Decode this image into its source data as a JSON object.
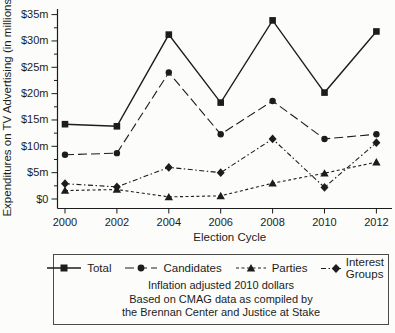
{
  "figure": {
    "ylabel": "Expenditures on TV Advertising (in millions)",
    "xlabel": "Election Cycle",
    "note_lines": [
      "Inflation adjusted 2010 dollars",
      "Based on CMAG data as compiled by",
      "the Brennan Center and Justice at Stake"
    ]
  },
  "chart_data": {
    "type": "line",
    "title": "",
    "xlabel": "Election Cycle",
    "ylabel": "Expenditures on TV Advertising (in millions)",
    "x": [
      2000,
      2002,
      2004,
      2006,
      2008,
      2010,
      2012
    ],
    "x_tick_labels": [
      "2000",
      "2002",
      "2004",
      "2006",
      "2008",
      "2010",
      "2012"
    ],
    "ylim": [
      0,
      35
    ],
    "y_major_step": 5,
    "y_minor_step": 2.5,
    "y_tick_labels": [
      "$0",
      "$5m",
      "$10m",
      "$15m",
      "$20m",
      "$25m",
      "$30m",
      "$35m"
    ],
    "grid": false,
    "legend_position": "bottom-box",
    "ink_color": "#1c1c1c",
    "series": [
      {
        "name": "Total",
        "marker": "square",
        "line": "solid",
        "values": [
          14.2,
          13.8,
          31.2,
          18.3,
          33.9,
          20.2,
          31.8
        ]
      },
      {
        "name": "Candidates",
        "marker": "circle",
        "line": "long-dash",
        "values": [
          8.4,
          8.7,
          24.0,
          12.3,
          18.6,
          11.4,
          12.3
        ]
      },
      {
        "name": "Parties",
        "marker": "triangle",
        "line": "short-dash",
        "values": [
          1.6,
          1.8,
          0.4,
          0.6,
          3.0,
          4.9,
          7.0
        ]
      },
      {
        "name": "Interest Groups",
        "marker": "diamond",
        "line": "dash-dot",
        "values": [
          2.9,
          2.3,
          6.0,
          5.0,
          11.4,
          2.2,
          10.7
        ]
      }
    ]
  }
}
